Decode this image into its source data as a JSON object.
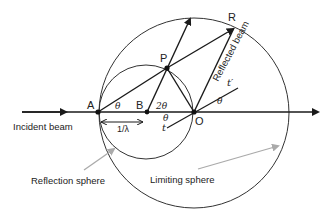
{
  "diagram": {
    "type": "ewald-sphere-construction",
    "points": {
      "A": "A",
      "B": "B",
      "O": "O",
      "P": "P",
      "R": "R"
    },
    "angles": {
      "theta_A": "θ",
      "two_theta_B": "2θ",
      "theta_O_upper": "θ",
      "theta_O_lower": "θ"
    },
    "vectors": {
      "t": "t",
      "t_prime": "t′"
    },
    "distance_label": "1/λ",
    "labels": {
      "incident_beam": "Incident beam",
      "reflected_beam": "Reflected beam",
      "reflection_sphere": "Reflection sphere",
      "limiting_sphere": "Limiting sphere"
    },
    "colors": {
      "line": "#1a1a1a",
      "pointer_arrow": "#aaaaaa",
      "text": "#222222"
    }
  }
}
